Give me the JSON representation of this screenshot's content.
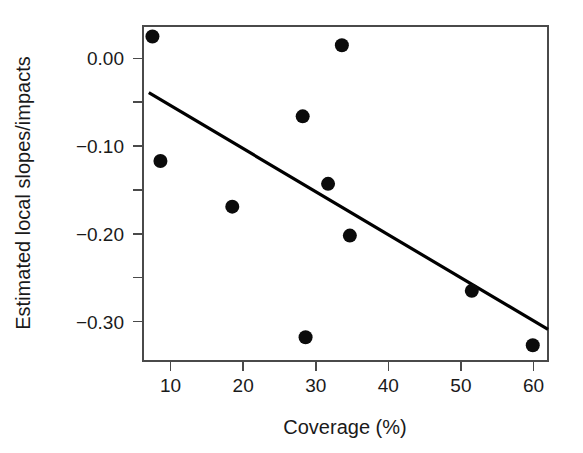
{
  "chart_data": {
    "type": "scatter",
    "title": "",
    "subtitle": "",
    "xlabel": "Coverage (%)",
    "ylabel": "Estimated local slopes/impacts",
    "xlim": [
      6.2,
      62.0
    ],
    "ylim": [
      -0.345,
      0.037
    ],
    "grid": false,
    "legend": null,
    "legend_position": "none",
    "xticks": [
      10,
      20,
      30,
      40,
      50,
      60
    ],
    "xticklabels": [
      "10",
      "20",
      "30",
      "40",
      "50",
      "60"
    ],
    "yticks": [
      0.0,
      -0.05,
      -0.1,
      -0.15,
      -0.2,
      -0.25,
      -0.3
    ],
    "yticklabels": [
      "0.00",
      "",
      "−0.10",
      "",
      "−0.20",
      "",
      "−0.30"
    ],
    "x": [
      7.5,
      8.6,
      18.5,
      28.2,
      28.6,
      31.7,
      33.6,
      34.7,
      51.5,
      59.9
    ],
    "y": [
      0.025,
      -0.117,
      -0.169,
      -0.066,
      -0.318,
      -0.143,
      0.015,
      -0.202,
      -0.265,
      -0.327
    ],
    "points": [
      {
        "x": 7.5,
        "y": 0.025
      },
      {
        "x": 8.6,
        "y": -0.117
      },
      {
        "x": 18.5,
        "y": -0.169
      },
      {
        "x": 28.2,
        "y": -0.066
      },
      {
        "x": 28.6,
        "y": -0.318
      },
      {
        "x": 31.7,
        "y": -0.143
      },
      {
        "x": 33.6,
        "y": 0.015
      },
      {
        "x": 34.7,
        "y": -0.202
      },
      {
        "x": 51.5,
        "y": -0.265
      },
      {
        "x": 59.9,
        "y": -0.327
      }
    ],
    "marker": {
      "shape": "circle",
      "size_px": 7,
      "color": "#0b0b0b"
    },
    "trendline": {
      "type": "linear-fit",
      "x_start": 7.0,
      "y_start": -0.039,
      "x_end": 62.0,
      "y_end": -0.309,
      "slope": -0.00491,
      "intercept": -0.0046,
      "color": "#000000",
      "width_px": 3.2
    },
    "frame": {
      "visible": true,
      "color": "#4a4a4a"
    }
  },
  "axes": {
    "x_title": "Coverage (%)",
    "y_title": "Estimated local slopes/impacts"
  },
  "colors": {
    "background": "#ffffff",
    "marker": "#0b0b0b",
    "line": "#000000",
    "frame": "#4a4a4a",
    "text": "#1a1a1a"
  }
}
